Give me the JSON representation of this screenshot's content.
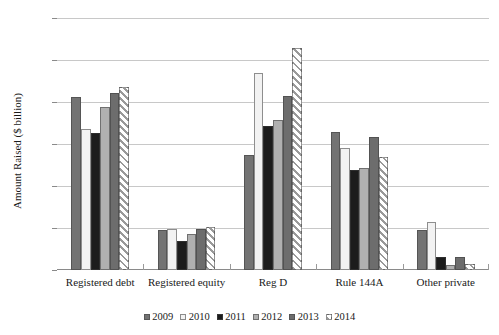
{
  "chart_data": {
    "type": "bar",
    "title": "",
    "xlabel": "",
    "ylabel": "Amount Raised ($ billion)",
    "ylim": [
      0,
      1500
    ],
    "yticks": [
      "0",
      "250",
      "500",
      "750",
      "1,000",
      "1,250",
      "1,500"
    ],
    "ytick_values": [
      0,
      250,
      500,
      750,
      1000,
      1250,
      1500
    ],
    "grid": true,
    "legend_position": "bottom",
    "categories": [
      "Registered debt",
      "Registered equity",
      "Reg D",
      "Rule 144A",
      "Other private"
    ],
    "series": [
      {
        "name": "2009",
        "color": "#737373",
        "values": [
          1030,
          240,
          685,
          820,
          240
        ]
      },
      {
        "name": "2010",
        "color": "#f2f2f2",
        "values": [
          840,
          245,
          1170,
          725,
          285
        ]
      },
      {
        "name": "2011",
        "color": "#1c1c1c",
        "values": [
          815,
          170,
          860,
          595,
          80
        ]
      },
      {
        "name": "2012",
        "color": "#b0b0b0",
        "values": [
          970,
          215,
          890,
          605,
          30
        ]
      },
      {
        "name": "2013",
        "color": "#6d6d6d",
        "values": [
          1055,
          245,
          1035,
          790,
          75
        ]
      },
      {
        "name": "2014",
        "color": "#ffffff",
        "values": [
          1090,
          255,
          1320,
          675,
          35
        ]
      }
    ]
  },
  "legend": {
    "items": [
      {
        "label": "2009"
      },
      {
        "label": "2010"
      },
      {
        "label": "2011"
      },
      {
        "label": "2012"
      },
      {
        "label": "2013"
      },
      {
        "label": "2014"
      }
    ]
  }
}
